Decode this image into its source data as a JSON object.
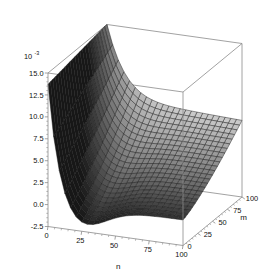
{
  "chart_data": {
    "type": "surface",
    "title": "",
    "xlabel": "n",
    "ylabel": "m",
    "zlabel": "",
    "z_exponent_label": "10",
    "z_exponent_sup": "-3",
    "z_scale": 0.001,
    "grid": false,
    "legend": "none",
    "colormap": "gray",
    "xlim": [
      0,
      100
    ],
    "ylim": [
      0,
      100
    ],
    "zlim": [
      -2.5,
      15.0
    ],
    "x_ticks": [
      0,
      25,
      50,
      75,
      100
    ],
    "x_tick_labels": [
      "0",
      "25",
      "50",
      "75",
      "100"
    ],
    "y_ticks": [
      0,
      25,
      50,
      75,
      100
    ],
    "y_tick_labels": [
      "0",
      "25",
      "50",
      "75",
      "100"
    ],
    "z_ticks": [
      -2.5,
      0.0,
      2.5,
      5.0,
      7.5,
      10.0,
      12.5,
      15.0
    ],
    "z_tick_labels": [
      "-2.5",
      "0.0",
      "2.5",
      "5.0",
      "7.5",
      "10.0",
      "12.5",
      "15.0"
    ],
    "view": {
      "azimuth": -37.5,
      "elevation": 22,
      "box": true
    },
    "mesh": {
      "n_steps": 24,
      "m_steps": 24
    },
    "surface_model": {
      "description": "z(n,m) in units of 1e-3; steep decay along n near n=0, shallow valley, rising toward large m",
      "a_peak": 15.0,
      "decay_n": 9.0,
      "valley_depth": -2.6,
      "valley_center_n": 22.0,
      "valley_width_n": 26.0,
      "m_rise": 6.2,
      "m_power": 1.35,
      "floor": 0.15
    },
    "samples_n": [
      0,
      4,
      8,
      12,
      17,
      21,
      25,
      29,
      33,
      38,
      42,
      46,
      50,
      54,
      58,
      62,
      67,
      71,
      75,
      79,
      83,
      88,
      92,
      96,
      100
    ],
    "samples_m": [
      0,
      4,
      8,
      12,
      17,
      21,
      25,
      29,
      33,
      38,
      42,
      46,
      50,
      54,
      58,
      62,
      67,
      71,
      75,
      79,
      83,
      88,
      92,
      96,
      100
    ],
    "z_at_m0": [
      15.0,
      6.4,
      1.2,
      -1.3,
      -2.4,
      -2.6,
      -2.5,
      -2.3,
      -2.1,
      -1.8,
      -1.6,
      -1.4,
      -1.2,
      -1.05,
      -0.9,
      -0.78,
      -0.66,
      -0.57,
      -0.49,
      -0.42,
      -0.36,
      -0.3,
      -0.26,
      -0.22,
      -0.2
    ],
    "z_at_m50": [
      15.0,
      7.2,
      2.6,
      0.6,
      -0.1,
      -0.2,
      -0.1,
      0.05,
      0.2,
      0.4,
      0.55,
      0.7,
      0.85,
      0.95,
      1.05,
      1.15,
      1.25,
      1.32,
      1.4,
      1.46,
      1.52,
      1.58,
      1.62,
      1.66,
      1.7
    ],
    "z_at_m100": [
      15.0,
      8.6,
      4.6,
      3.0,
      2.6,
      2.7,
      2.9,
      3.1,
      3.35,
      3.6,
      3.8,
      4.0,
      4.2,
      4.35,
      4.5,
      4.62,
      4.75,
      4.85,
      4.95,
      5.05,
      5.12,
      5.2,
      5.26,
      5.3,
      5.35
    ]
  },
  "axes": {
    "z_exponent": "10",
    "z_exponent_superscript": "-3",
    "x_axis_label": "n",
    "y_axis_label": "m"
  },
  "colors": {
    "background": "#ffffff",
    "wireframe": "#8a8a8a",
    "mesh_line": "#1a1a1a",
    "text": "#111111",
    "surface_dark": "#151515",
    "surface_light": "#e8e8e8"
  }
}
